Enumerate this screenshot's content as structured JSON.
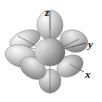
{
  "figure": {
    "background_color": "#ffffff",
    "center": {
      "x": 50,
      "y": 52
    },
    "axes": {
      "line_color": "#4a4a4a",
      "labels": [
        {
          "name": "z",
          "text": "z",
          "x": 45,
          "y": 16
        },
        {
          "name": "y",
          "text": "y",
          "x": 88,
          "y": 48
        },
        {
          "name": "x",
          "text": "x",
          "x": 85,
          "y": 78
        }
      ],
      "lines": [
        {
          "name": "z-axis",
          "x1": 50,
          "y1": 10,
          "x2": 50,
          "y2": 94
        },
        {
          "name": "y-axis",
          "x1": 16,
          "y1": 62,
          "x2": 86,
          "y2": 42
        },
        {
          "name": "x-axis",
          "x1": 18,
          "y1": 36,
          "x2": 84,
          "y2": 72
        },
        {
          "name": "diagonal-a",
          "x1": 20,
          "y1": 44,
          "x2": 80,
          "y2": 62
        },
        {
          "name": "diagonal-b",
          "x1": 22,
          "y1": 66,
          "x2": 78,
          "y2": 38
        }
      ]
    },
    "lobe_fill": {
      "highlight": "#f2f2f2",
      "mid": "#bdbdbd",
      "shadow": "#6e6e6e",
      "edge": "#7a7a7a"
    },
    "lobes": [
      {
        "name": "lobe-z-positive",
        "cx": 50,
        "cy": 25,
        "rx": 13,
        "ry": 15,
        "rot": 0,
        "shade": "light"
      },
      {
        "name": "lobe-z-negative",
        "cx": 50,
        "cy": 81,
        "rx": 11,
        "ry": 12,
        "rot": 0,
        "shade": "mid"
      },
      {
        "name": "lobe-upper-left",
        "cx": 25,
        "cy": 40,
        "rx": 16,
        "ry": 9,
        "rot": -22,
        "shade": "light"
      },
      {
        "name": "lobe-upper-right",
        "cx": 74,
        "cy": 40,
        "rx": 14,
        "ry": 11,
        "rot": 18,
        "shade": "mid"
      },
      {
        "name": "lobe-left",
        "cx": 21,
        "cy": 56,
        "rx": 16,
        "ry": 11,
        "rot": 14,
        "shade": "light"
      },
      {
        "name": "lobe-lower-left",
        "cx": 32,
        "cy": 68,
        "rx": 14,
        "ry": 10,
        "rot": 34,
        "shade": "mid"
      },
      {
        "name": "lobe-lower-right",
        "cx": 70,
        "cy": 66,
        "rx": 14,
        "ry": 10,
        "rot": -30,
        "shade": "mid"
      },
      {
        "name": "lobe-center-front",
        "cx": 50,
        "cy": 52,
        "rx": 15,
        "ry": 14,
        "rot": 0,
        "shade": "dark"
      }
    ]
  }
}
